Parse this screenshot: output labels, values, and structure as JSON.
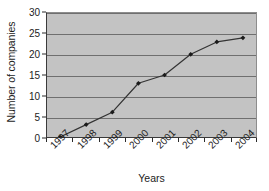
{
  "chart_data": {
    "type": "line",
    "title": "",
    "subtitle": "",
    "xlabel": "Years",
    "ylabel": "Number of companies",
    "categories": [
      "1997",
      "1998",
      "1999",
      "2000",
      "2001",
      "2002",
      "2003",
      "2004"
    ],
    "values": [
      0,
      3,
      6,
      13,
      15,
      20,
      23,
      24
    ],
    "series": [
      {
        "name": "Number of companies",
        "values": [
          0,
          3,
          6,
          13,
          15,
          20,
          23,
          24
        ]
      }
    ],
    "ylim": [
      0,
      30
    ],
    "y_ticks": [
      0,
      5,
      10,
      15,
      20,
      25,
      30
    ],
    "y_tick_labels": [
      "0",
      "5",
      "10",
      "15",
      "20",
      "25",
      "30"
    ],
    "x_tick_labels": [
      "1997",
      "1998",
      "1999",
      "2000",
      "2001",
      "2002",
      "2003",
      "2004"
    ],
    "grid": "horizontal",
    "legend": "none",
    "marker": "filled-diamond",
    "colors": {
      "plot_background": "#c3c3c3",
      "gridline": "#6f6f6f",
      "axis": "#3a3a3a",
      "series_line": "#333333",
      "marker": "#1a1a1a",
      "text": "#1c1c1c",
      "figure_background": "#ffffff"
    }
  }
}
